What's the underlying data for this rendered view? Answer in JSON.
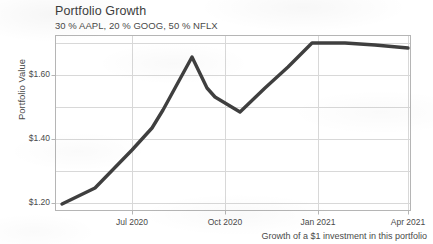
{
  "chart_data": {
    "type": "line",
    "title": "Portfolio Growth",
    "subtitle": "30 % AAPL,  20 % GOOG,  50 % NFLX",
    "caption": "Growth of a $1 investment in this portfolio",
    "xlabel": "",
    "ylabel": "Portfolio Value",
    "grid": true,
    "legend": "none",
    "line_color": "#3f3f3f",
    "grid_color": "#d8d8d8",
    "axis_color": "#b5b5b5",
    "xlim": [
      "2020-05-15",
      "2021-04-15"
    ],
    "ylim": [
      1.13,
      1.735
    ],
    "x_tick_labels": [
      "Jul 2020",
      "Oct 2020",
      "Jan 2021",
      "Apr 2021"
    ],
    "x_tick_positions": [
      132,
      225,
      318,
      408
    ],
    "y_tick_labels": [
      "$1.20",
      "$1.40",
      "$1.60"
    ],
    "y_tick_values": [
      1.2,
      1.4,
      1.6
    ],
    "y_minor_gridlines": [
      1.3,
      1.5,
      1.7
    ],
    "series": [
      {
        "name": "Portfolio Value",
        "x": [
          "2020-05-20",
          "2020-06-10",
          "2020-07-01",
          "2020-07-22",
          "2020-08-12",
          "2020-09-02",
          "2020-09-18",
          "2020-10-07",
          "2020-10-26",
          "2020-11-16",
          "2020-12-08",
          "2021-01-04",
          "2021-02-01",
          "2021-03-01",
          "2021-04-05"
        ],
        "values": [
          1.195,
          1.25,
          1.37,
          1.44,
          1.49,
          1.665,
          1.565,
          1.535,
          1.495,
          1.56,
          1.625,
          1.7,
          1.702,
          1.697,
          1.685
        ]
      }
    ],
    "points_px": [
      [
        62,
        204
      ],
      [
        95,
        188
      ],
      [
        132,
        150
      ],
      [
        152,
        128
      ],
      [
        163,
        110
      ],
      [
        192,
        57
      ],
      [
        207,
        88
      ],
      [
        215,
        97
      ],
      [
        240,
        112
      ],
      [
        265,
        88
      ],
      [
        288,
        67
      ],
      [
        312,
        43
      ],
      [
        345,
        43
      ],
      [
        375,
        45
      ],
      [
        408,
        48
      ]
    ]
  }
}
